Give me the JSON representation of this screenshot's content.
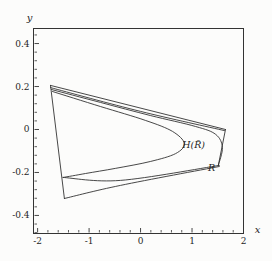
{
  "figure": {
    "xlabel": "x",
    "ylabel": "y",
    "curve_label_hull": "H(R̄)",
    "curve_label_range": "R"
  },
  "chart_data": {
    "type": "line",
    "title": "",
    "xlabel": "x",
    "ylabel": "y",
    "xlim": [
      -2.08,
      2.0
    ],
    "ylim": [
      -0.484,
      0.47
    ],
    "grid": false,
    "legend": "none",
    "xticks": [
      {
        "v": -2,
        "label": "-2"
      },
      {
        "v": -1,
        "label": "-1"
      },
      {
        "v": 0,
        "label": "0"
      },
      {
        "v": 1,
        "label": "1"
      },
      {
        "v": 2,
        "label": "2"
      }
    ],
    "yticks": [
      {
        "v": 0.4,
        "label": "0.4"
      },
      {
        "v": 0.2,
        "label": "0.2"
      },
      {
        "v": 0,
        "label": "0"
      },
      {
        "v": -0.2,
        "label": "-0.2"
      },
      {
        "v": -0.4,
        "label": "-0.4"
      }
    ],
    "x_minor_step": 0.2,
    "y_minor_step": 0.04,
    "annotations": [
      {
        "name": "hull-label",
        "text": "H(R̄)",
        "x": 1.03,
        "y": -0.074,
        "size": 9.5
      },
      {
        "name": "range-label",
        "text": "R",
        "x": 1.38,
        "y": -0.181,
        "size": 9.5
      }
    ],
    "series": [
      {
        "name": "left-edge",
        "points": [
          [
            -1.75,
            0.205
          ],
          [
            -1.48,
            -0.321
          ]
        ]
      },
      {
        "name": "top-edge-outer",
        "points": [
          [
            -1.75,
            0.205
          ],
          [
            1.65,
            0.0
          ]
        ]
      },
      {
        "name": "top-edge-inner",
        "points": [
          [
            -1.75,
            0.195
          ],
          [
            0.0,
            0.084
          ],
          [
            1.63,
            -0.005
          ]
        ]
      },
      {
        "name": "right-edge",
        "points": [
          [
            1.65,
            0.0
          ],
          [
            1.51,
            -0.167
          ]
        ]
      },
      {
        "name": "bottom-edge-upper",
        "points": [
          [
            -1.51,
            -0.223
          ],
          [
            -0.39,
            -0.237
          ],
          [
            1.53,
            -0.167
          ]
        ]
      },
      {
        "name": "bottom-edge-lower",
        "points": [
          [
            -1.48,
            -0.321
          ],
          [
            -0.39,
            -0.26
          ],
          [
            1.53,
            -0.172
          ]
        ]
      },
      {
        "name": "hull-curve-outer",
        "points": [
          [
            -1.73,
            0.186
          ],
          [
            -0.78,
            0.126
          ],
          [
            0.19,
            0.065
          ],
          [
            1.07,
            0.014
          ],
          [
            1.46,
            -0.023
          ],
          [
            1.59,
            -0.084
          ],
          [
            1.51,
            -0.167
          ]
        ]
      },
      {
        "name": "range-curve-inner",
        "points": [
          [
            -1.71,
            0.177
          ],
          [
            -0.78,
            0.107
          ],
          [
            0.1,
            0.042
          ],
          [
            0.62,
            -0.009
          ],
          [
            0.85,
            -0.065
          ],
          [
            0.68,
            -0.112
          ],
          [
            0.19,
            -0.149
          ],
          [
            -0.49,
            -0.181
          ],
          [
            -1.07,
            -0.205
          ],
          [
            -1.5,
            -0.223
          ]
        ]
      }
    ]
  }
}
